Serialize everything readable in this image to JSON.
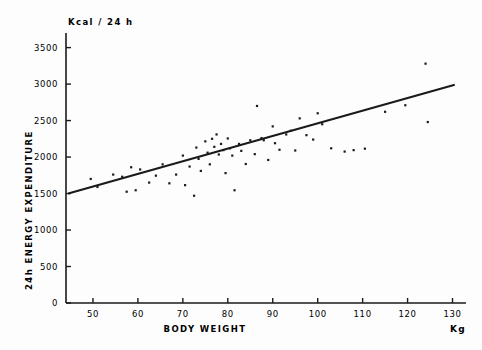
{
  "chart_data": {
    "type": "scatter",
    "title": "",
    "xlabel": "BODY   WEIGHT",
    "xunit": "Kg",
    "ylabel": "24h  ENERGY  EXPENDITURE",
    "yunit": "Kcal / 24 h",
    "xlim": [
      44,
      133
    ],
    "ylim": [
      0,
      3700
    ],
    "xticks": [
      50,
      60,
      70,
      80,
      90,
      100,
      110,
      120,
      130
    ],
    "yticks": [
      0,
      500,
      1000,
      1500,
      2000,
      2500,
      3000,
      3500
    ],
    "xtick_labels": [
      "50",
      "60",
      "70",
      "80",
      "90",
      "100",
      "110",
      "120",
      "130"
    ],
    "ytick_labels": [
      "0",
      "500",
      "1000",
      "1500",
      "2000",
      "2500",
      "3000",
      "3500"
    ],
    "grid": false,
    "legend": false,
    "marker_color": "#1a1a1a",
    "line_color": "#1a1a1a",
    "axis_color": "#1a1a1a",
    "series": [
      {
        "name": "subjects",
        "type": "scatter",
        "points": [
          [
            49.5,
            1700
          ],
          [
            51.0,
            1590
          ],
          [
            54.5,
            1760
          ],
          [
            56.5,
            1730
          ],
          [
            57.5,
            1525
          ],
          [
            58.5,
            1860
          ],
          [
            59.5,
            1545
          ],
          [
            60.5,
            1830
          ],
          [
            62.5,
            1650
          ],
          [
            64.0,
            1745
          ],
          [
            65.5,
            1900
          ],
          [
            67.0,
            1640
          ],
          [
            68.5,
            1760
          ],
          [
            70.0,
            2020
          ],
          [
            70.5,
            1615
          ],
          [
            71.5,
            1870
          ],
          [
            72.5,
            1470
          ],
          [
            73.0,
            2130
          ],
          [
            73.5,
            1975
          ],
          [
            74.0,
            1810
          ],
          [
            75.0,
            2215
          ],
          [
            75.5,
            2060
          ],
          [
            76.0,
            1900
          ],
          [
            76.5,
            2250
          ],
          [
            77.0,
            2140
          ],
          [
            77.5,
            2310
          ],
          [
            78.0,
            2035
          ],
          [
            78.5,
            2180
          ],
          [
            79.0,
            2095
          ],
          [
            79.5,
            1780
          ],
          [
            80.0,
            2255
          ],
          [
            80.5,
            2120
          ],
          [
            81.0,
            2020
          ],
          [
            81.5,
            1545
          ],
          [
            82.5,
            2180
          ],
          [
            83.0,
            2085
          ],
          [
            84.0,
            1905
          ],
          [
            85.0,
            2230
          ],
          [
            86.0,
            2040
          ],
          [
            86.5,
            2700
          ],
          [
            87.5,
            2260
          ],
          [
            88.0,
            2230
          ],
          [
            89.0,
            1960
          ],
          [
            90.0,
            2420
          ],
          [
            90.5,
            2190
          ],
          [
            91.5,
            2100
          ],
          [
            93.0,
            2310
          ],
          [
            94.0,
            2360
          ],
          [
            95.0,
            2090
          ],
          [
            96.0,
            2530
          ],
          [
            97.5,
            2300
          ],
          [
            99.0,
            2240
          ],
          [
            100.0,
            2600
          ],
          [
            101.0,
            2450
          ],
          [
            103.0,
            2120
          ],
          [
            106.0,
            2075
          ],
          [
            108.0,
            2095
          ],
          [
            110.5,
            2115
          ],
          [
            115.0,
            2620
          ],
          [
            119.5,
            2710
          ],
          [
            124.0,
            3280
          ],
          [
            124.5,
            2480
          ]
        ]
      },
      {
        "name": "regression-line",
        "type": "line",
        "x": [
          44.5,
          130.5
        ],
        "y": [
          1500,
          2990
        ]
      }
    ]
  },
  "axes": {
    "y_axis_title": "Kcal / 24 h",
    "y_label_text": "24h  ENERGY  EXPENDITURE",
    "x_label_text": "BODY   WEIGHT",
    "x_unit_text": "Kg"
  }
}
